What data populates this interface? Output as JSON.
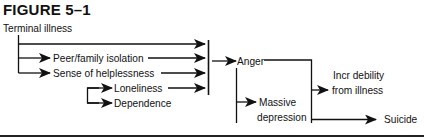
{
  "figure": {
    "title": "FIGURE 5–1"
  },
  "nodes": {
    "terminal_illness": "Terminal illness",
    "peer_family_isolation": "Peer/family isolation",
    "sense_of_helplessness": "Sense of helplessness",
    "loneliness": "Loneliness",
    "dependence": "Dependence",
    "anger": "Anger",
    "massive_depression_line1": "Massive",
    "massive_depression_line2": "depression",
    "incr_debility_line1": "Incr debility",
    "incr_debility_line2": "from illness",
    "suicide": "Suicide"
  },
  "edges": [
    {
      "from": "Terminal illness",
      "to": "Peer/family isolation"
    },
    {
      "from": "Terminal illness",
      "to": "Sense of helplessness"
    },
    {
      "from": "Sense of helplessness",
      "to": "Loneliness"
    },
    {
      "from": "Sense of helplessness",
      "to": "Dependence"
    },
    {
      "from": "Terminal illness",
      "to": "Anger"
    },
    {
      "from": "Peer/family isolation",
      "to": "Anger"
    },
    {
      "from": "Sense of helplessness",
      "to": "Anger"
    },
    {
      "from": "Loneliness",
      "to": "Anger"
    },
    {
      "from": "Anger",
      "to": "Massive depression"
    },
    {
      "from": "Anger",
      "to": "Incr debility from illness"
    },
    {
      "from": "Massive depression",
      "to": "Incr debility from illness"
    },
    {
      "from": "Massive depression",
      "to": "Suicide"
    }
  ],
  "colors": {
    "ink": "#111111",
    "background": "#ffffff"
  }
}
